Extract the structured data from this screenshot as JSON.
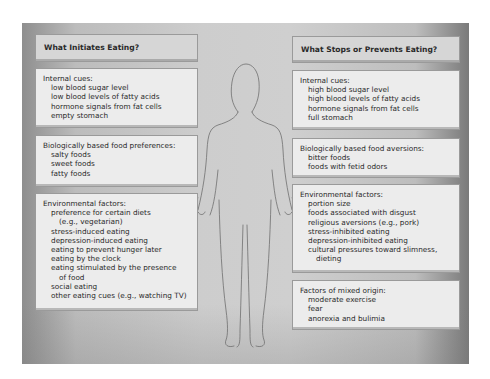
{
  "left": {
    "heading": "What Initiates Eating?",
    "sections": [
      {
        "title": "Internal cues:",
        "items": [
          "low blood sugar level",
          "low blood levels of fatty acids",
          "hormone signals from fat cells",
          "empty stomach"
        ]
      },
      {
        "title": "Biologically based food preferences:",
        "items": [
          "salty foods",
          "sweet foods",
          "fatty foods"
        ]
      },
      {
        "title": "Environmental factors:",
        "items": [
          "preference for certain diets",
          "(e.g., vegetarian)",
          "stress-induced eating",
          "depression-induced eating",
          "eating to prevent hunger later",
          "eating by the clock",
          "eating stimulated by the presence",
          "of food",
          "social eating",
          "other eating cues (e.g., watching TV)"
        ]
      }
    ]
  },
  "right": {
    "heading": "What Stops or Prevents Eating?",
    "sections": [
      {
        "title": "Internal cues:",
        "items": [
          "high blood sugar level",
          "high blood levels of fatty acids",
          "hormone signals from fat cells",
          "full stomach"
        ]
      },
      {
        "title": "Biologically based food aversions:",
        "items": [
          "bitter foods",
          "foods with fetid odors"
        ]
      },
      {
        "title": "Environmental factors:",
        "items": [
          "portion size",
          "foods associated with disgust",
          "religious aversions (e.g., pork)",
          "stress-inhibited eating",
          "depression-inhibited eating",
          "cultural pressures toward slimness,",
          "dieting"
        ]
      },
      {
        "title": "Factors of mixed origin:",
        "items": [
          "moderate exercise",
          "fear",
          "anorexia and bulimia"
        ]
      }
    ]
  },
  "figure": {
    "icon": "human-silhouette-outline",
    "stroke_color": "#6e6e6e"
  },
  "colors": {
    "panel_mid": "#cdcdcd",
    "panel_edge": "#7a7a7a",
    "box_fill": "#ececec",
    "header_fill": "#d6d6d6",
    "text": "#2a2a2a"
  }
}
